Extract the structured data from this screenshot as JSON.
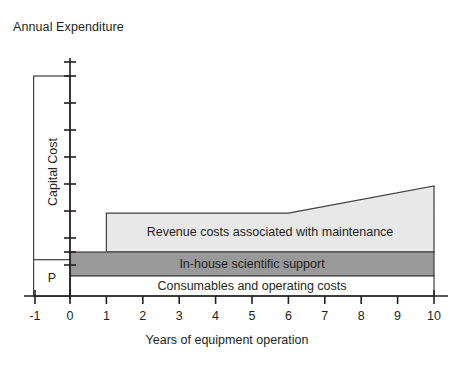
{
  "chart_data": {
    "type": "area",
    "title": "Annual Expenditure",
    "xlabel": "Years of equipment operation",
    "ylabel": "Annual Expenditure",
    "grid": false,
    "legend": "none",
    "xlim": [
      -1,
      10
    ],
    "ylim": [
      0,
      100
    ],
    "xticks": [
      "-1",
      "0",
      "1",
      "2",
      "3",
      "4",
      "5",
      "6",
      "7",
      "8",
      "9",
      "10"
    ],
    "xtick_values": [
      -1,
      0,
      1,
      2,
      3,
      4,
      5,
      6,
      7,
      8,
      9,
      10
    ],
    "yticks_unlabeled": 9,
    "capital_cost": {
      "label": "Capital Cost",
      "x_start": -1,
      "x_end": 0,
      "y_bottom": 0,
      "y_top": 100,
      "fill": "#ffffff",
      "sub_block": {
        "label": "P",
        "y_bottom": 0,
        "y_top": 16.5,
        "fill": "#ffffff"
      }
    },
    "series": [
      {
        "name": "Consumables and operating costs",
        "label": "Consumables and operating costs",
        "fill": "#ffffff",
        "x_start": 0,
        "x_end": 10,
        "y_bottom": 0,
        "y_top": 9.1,
        "sloped": false
      },
      {
        "name": "In-house scientific support",
        "label": "In-house scientific support",
        "fill": "#9a9a9a",
        "x_start": 0,
        "x_end": 10,
        "y_bottom": 9.1,
        "y_top": 20.0,
        "sloped": false
      },
      {
        "name": "Revenue costs associated with maintenance",
        "label": "Revenue costs associated with maintenance",
        "fill": "#e8e8e8",
        "x_start": 1,
        "x_end": 10,
        "y_bottom": 20.0,
        "y_top_flat": 37.7,
        "slope_start_x": 6,
        "y_top_at_10": 50.0,
        "sloped": true
      }
    ]
  },
  "axis": {
    "title": "Annual Expenditure",
    "x_title": "Years of equipment operation"
  },
  "labels": {
    "capital_cost": "Capital Cost",
    "p": "P",
    "revenue": "Revenue costs associated with maintenance",
    "inhouse": "In-house scientific support",
    "consumables": "Consumables and operating costs"
  },
  "ticks": {
    "x": [
      "-1",
      "0",
      "1",
      "2",
      "3",
      "4",
      "5",
      "6",
      "7",
      "8",
      "9",
      "10"
    ]
  },
  "colors": {
    "stroke": "#3f3f3f",
    "light_gray": "#e8e8e8",
    "mid_gray": "#9a9a9a",
    "white": "#ffffff",
    "text": "#231f20"
  }
}
